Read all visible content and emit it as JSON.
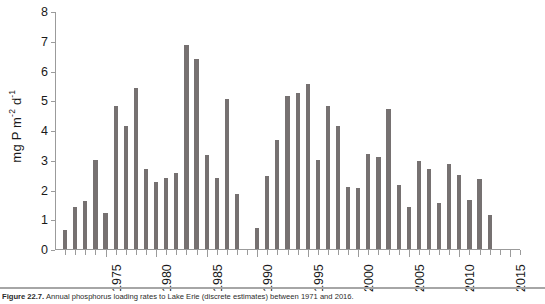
{
  "figure": {
    "caption_label": "Figure 22.7.",
    "caption_text": "Annual phosphorus loading rates to Lake Erie (discrete estimates) between 1971 and 2016."
  },
  "axis": {
    "y_title_main": "mg P m",
    "y_title_sup1": "-2",
    "y_title_mid": " d",
    "y_title_sup2": "-1",
    "y_ticks": [
      "0",
      "1",
      "2",
      "3",
      "4",
      "5",
      "6",
      "7",
      "8"
    ],
    "y_min": 0,
    "y_max": 8,
    "x_tick_labels": [
      "1975",
      "1980",
      "1985",
      "1990",
      "1995",
      "2000",
      "2005",
      "2010",
      "2015"
    ]
  },
  "style": {
    "bar_color": "#767171",
    "axis_color": "#9b9b9b",
    "text_color": "#1a1a1a",
    "background": "#ffffff"
  },
  "chart_data": {
    "type": "bar",
    "title": "",
    "xlabel": "",
    "ylabel": "mg P m-2 d-1",
    "ylim": [
      0,
      8
    ],
    "xlim": [
      1970.5,
      2016.5
    ],
    "grid": false,
    "legend": "none",
    "categories": [
      "1971",
      "1972",
      "1973",
      "1974",
      "1975",
      "1976",
      "1977",
      "1978",
      "1979",
      "1980",
      "1981",
      "1982",
      "1983",
      "1984",
      "1985",
      "1986",
      "1987",
      "1988",
      "1989",
      "1990",
      "1991",
      "1992",
      "1993",
      "1994",
      "1995",
      "1996",
      "1997",
      "1998",
      "1999",
      "2000",
      "2001",
      "2002",
      "2003",
      "2004",
      "2005",
      "2006",
      "2007",
      "2008",
      "2009",
      "2010",
      "2011",
      "2012",
      "2013",
      "2014",
      "2015",
      "2016"
    ],
    "values": [
      0.65,
      1.4,
      1.6,
      3.0,
      1.2,
      4.8,
      4.15,
      5.4,
      2.7,
      2.25,
      2.4,
      2.55,
      6.85,
      6.4,
      3.15,
      2.4,
      5.05,
      1.85,
      null,
      0.7,
      2.45,
      3.65,
      5.15,
      5.25,
      5.55,
      3.0,
      4.8,
      4.15,
      2.1,
      2.05,
      3.2,
      3.1,
      4.7,
      2.15,
      1.4,
      2.95,
      2.7,
      1.55,
      2.85,
      2.5,
      1.65,
      2.35,
      1.15,
      null,
      null,
      null
    ],
    "series_name": "Phosphorus loading rate",
    "units": "mg P m-2 d-1"
  }
}
